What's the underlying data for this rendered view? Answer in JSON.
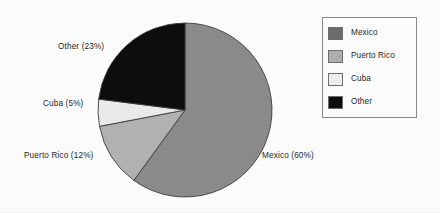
{
  "chart_data": {
    "type": "pie",
    "title": "",
    "categories": [
      "Mexico",
      "Puerto Rico",
      "Cuba",
      "Other"
    ],
    "values": [
      60,
      12,
      5,
      23
    ],
    "unit": "%",
    "start_angle_deg": 0,
    "direction": "clockwise",
    "legend_position": "right",
    "grid": false,
    "slices": [
      {
        "label": "Mexico",
        "value": 60,
        "color": "#8c8c8c",
        "callout": "Mexico (60%)"
      },
      {
        "label": "Puerto Rico",
        "value": 12,
        "color": "#b3b3b3",
        "callout": "Puerto Rico (12%)"
      },
      {
        "label": "Cuba",
        "value": 5,
        "color": "#ededed",
        "callout": "Cuba (5%)"
      },
      {
        "label": "Other",
        "value": 23,
        "color": "#0d0d0d",
        "callout": "Other (23%)"
      }
    ]
  },
  "callouts": {
    "other": "Other (23%)",
    "cuba": "Cuba (5%)",
    "puerto_rico": "Puerto Rico (12%)",
    "mexico": "Mexico (60%)"
  },
  "legend": {
    "items": [
      {
        "label": "Mexico",
        "color": "#6e6e6e"
      },
      {
        "label": "Puerto Rico",
        "color": "#b0b0b0"
      },
      {
        "label": "Cuba",
        "color": "#f0f0f0"
      },
      {
        "label": "Other",
        "color": "#0d0d0d"
      }
    ]
  },
  "colors": {
    "background": "#ffffff",
    "text": "#262626",
    "legend_border": "#8a8a8a",
    "slice_outline": "#3d3d3d"
  }
}
